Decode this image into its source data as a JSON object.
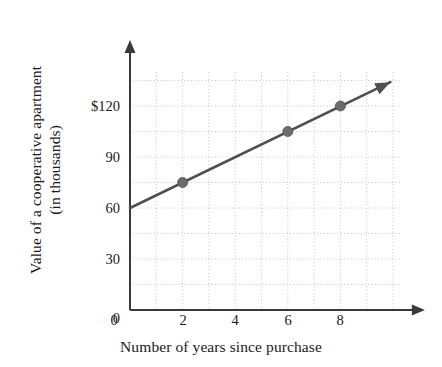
{
  "chart_data": {
    "type": "line",
    "title": "",
    "xlabel": "Number of years since purchase",
    "ylabel_line1": "Value of a cooperative apartment",
    "ylabel_line2": "(in thousands)",
    "xlim": [
      0,
      10.3
    ],
    "ylim": [
      0,
      140
    ],
    "xticks": [
      0,
      2,
      4,
      6,
      8
    ],
    "xtick_labels": [
      "0",
      "2",
      "4",
      "6",
      "8"
    ],
    "yticks": [
      0,
      30,
      60,
      90,
      120
    ],
    "ytick_labels": [
      "0",
      "30",
      "60",
      "90",
      "$120"
    ],
    "grid": true,
    "grid_style": "dotted",
    "grid_x_step": 1,
    "grid_y_step": 15,
    "legend": "none",
    "axis_arrows": true,
    "series": [
      {
        "name": "Value of a cooperative apartment",
        "line_from": {
          "x": 0,
          "y": 60
        },
        "line_to": {
          "x": 9.9,
          "y": 134
        },
        "line_arrow": true,
        "intercept": 60,
        "slope": 7.5,
        "x": [
          2,
          6,
          8
        ],
        "values": [
          75,
          105,
          120
        ],
        "marker": "circle"
      }
    ],
    "colors": {
      "line": "#4f4f52",
      "marker": "#6b6b70",
      "axis": "#3a3a3a",
      "grid": "#c3c3c3",
      "text": "#1a1a1a",
      "background": "#ffffff"
    }
  }
}
